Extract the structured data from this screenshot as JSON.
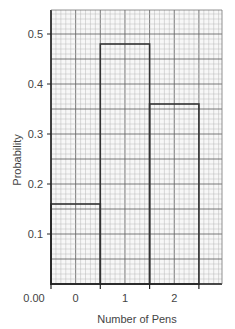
{
  "chart_data": {
    "type": "bar",
    "style": "histogram-on-graph-paper",
    "title": "",
    "xlabel": "Number of Pens",
    "ylabel": "Probability",
    "categories": [
      "0",
      "1",
      "2"
    ],
    "values": [
      0.16,
      0.48,
      0.36
    ],
    "ylim": [
      0,
      0.55
    ],
    "yticks": [
      0.1,
      0.2,
      0.3,
      0.4,
      0.5
    ],
    "ytick_labels": [
      "0.1",
      "0.2",
      "0.3",
      "0.4",
      "0.5"
    ],
    "origin_label": "0.00",
    "grid": true,
    "legend": null
  },
  "colors": {
    "grid_minor": "#b8b8b8",
    "grid_major": "#6a6a6a",
    "bars": "#333333",
    "axis": "#222222",
    "text": "#444444"
  }
}
